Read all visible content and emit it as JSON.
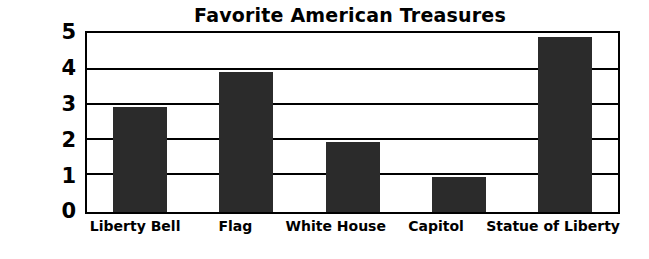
{
  "chart_data": {
    "type": "bar",
    "title": "Favorite American Treasures",
    "xlabel": "",
    "ylabel": "Number of Kids",
    "categories": [
      "Liberty Bell",
      "Flag",
      "White House",
      "Capitol",
      "Statue of Liberty"
    ],
    "values": [
      3,
      4,
      2,
      1,
      5
    ],
    "ylim": [
      0,
      5
    ],
    "yticks": [
      "0",
      "1",
      "2",
      "3",
      "4",
      "5"
    ],
    "grid": true,
    "legend": "none",
    "bar_color": "#2b2b2b",
    "axis_color": "#000000",
    "background": "#ffffff"
  }
}
